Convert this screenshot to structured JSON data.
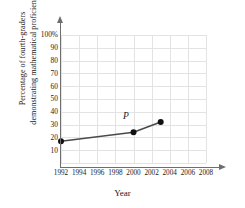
{
  "chart_data": {
    "type": "line",
    "title": "",
    "xlabel": "Year",
    "ylabel_line1": "Percentage of fourth-graders",
    "ylabel_line2": "demonstrating mathematical proficiency",
    "x": [
      1992,
      2000,
      2003
    ],
    "values": [
      17,
      24,
      32
    ],
    "series": [
      {
        "name": "Fourth-grade math proficiency",
        "values": [
          17,
          24,
          32
        ]
      }
    ],
    "xlim": [
      1992,
      2008
    ],
    "ylim": [
      0,
      100
    ],
    "xticks": [
      1992,
      1994,
      1996,
      1998,
      2000,
      2002,
      2004,
      2006,
      2008
    ],
    "xtick_labels": [
      "1992",
      "1994",
      "1996",
      "1998",
      "2000",
      "2002",
      "2004",
      "2006",
      "2008"
    ],
    "yticks": [
      10,
      20,
      30,
      40,
      50,
      60,
      70,
      80,
      90,
      100
    ],
    "ytick_labels": [
      "10",
      "20",
      "30",
      "40",
      "50",
      "60",
      "70",
      "80",
      "90",
      "100%"
    ],
    "grid": true,
    "legend": "none",
    "annotations": [
      {
        "text": "P",
        "x": 2000,
        "y": 24,
        "style": "italic"
      }
    ],
    "colors": {
      "line": "#4a4a4a",
      "marker": "#111111",
      "grid": "#e3e3e3",
      "axis": "#6e6e6e",
      "background": "#ffffff"
    }
  }
}
